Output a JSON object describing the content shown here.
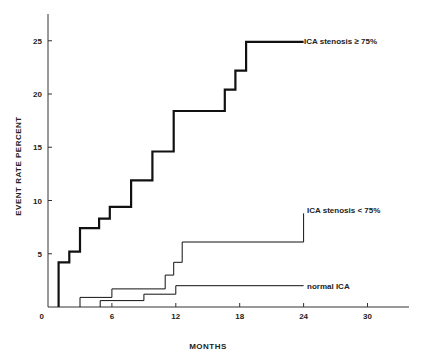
{
  "chart_data": {
    "type": "line",
    "subtype": "step",
    "title": "",
    "xlabel": "MONTHS",
    "ylabel": "EVENT RATE PERCENT",
    "xlim": [
      0,
      34
    ],
    "ylim": [
      0,
      27
    ],
    "x_ticks": [
      0,
      6,
      12,
      18,
      24,
      30
    ],
    "y_ticks": [
      0,
      5,
      10,
      15,
      20,
      25
    ],
    "grid": false,
    "legend": "inline labels at line ends",
    "series": [
      {
        "name": "ICA stenosis ≥ 75%",
        "style": "thick",
        "points": [
          [
            1.0,
            0
          ],
          [
            1.0,
            4.2
          ],
          [
            2.0,
            4.2
          ],
          [
            2.0,
            5.2
          ],
          [
            3.0,
            5.2
          ],
          [
            3.0,
            7.4
          ],
          [
            4.8,
            7.4
          ],
          [
            4.8,
            8.3
          ],
          [
            5.8,
            8.3
          ],
          [
            5.8,
            9.4
          ],
          [
            7.8,
            9.4
          ],
          [
            7.8,
            11.9
          ],
          [
            9.8,
            11.9
          ],
          [
            9.8,
            14.6
          ],
          [
            11.8,
            14.6
          ],
          [
            11.8,
            18.4
          ],
          [
            16.6,
            18.4
          ],
          [
            16.6,
            20.4
          ],
          [
            17.6,
            20.4
          ],
          [
            17.6,
            22.2
          ],
          [
            18.6,
            22.2
          ],
          [
            18.6,
            24.9
          ],
          [
            24.0,
            24.9
          ]
        ]
      },
      {
        "name": "ICA stenosis < 75%",
        "style": "thin",
        "points": [
          [
            3.0,
            0
          ],
          [
            3.0,
            0.9
          ],
          [
            6.0,
            0.9
          ],
          [
            6.0,
            1.7
          ],
          [
            11.0,
            1.7
          ],
          [
            11.0,
            3.0
          ],
          [
            11.8,
            3.0
          ],
          [
            11.8,
            4.2
          ],
          [
            12.6,
            4.2
          ],
          [
            12.6,
            6.1
          ],
          [
            24.0,
            6.1
          ],
          [
            24.0,
            8.8
          ]
        ]
      },
      {
        "name": "normal ICA",
        "style": "thin",
        "points": [
          [
            4.9,
            0
          ],
          [
            4.9,
            0.6
          ],
          [
            9.0,
            0.6
          ],
          [
            9.0,
            1.2
          ],
          [
            12.0,
            1.2
          ],
          [
            12.0,
            2.0
          ],
          [
            24.0,
            2.0
          ]
        ]
      }
    ]
  },
  "labels": {
    "ylabel": "EVENT RATE PERCENT",
    "xlabel": "MONTHS",
    "series_high": "ICA stenosis ≥ 75%",
    "series_mid": "ICA stenosis < 75%",
    "series_normal": "normal ICA",
    "x_ticks": [
      "0",
      "6",
      "12",
      "18",
      "24",
      "30"
    ],
    "y_ticks": [
      "5",
      "10",
      "15",
      "20",
      "25"
    ],
    "y_zero": "0"
  }
}
